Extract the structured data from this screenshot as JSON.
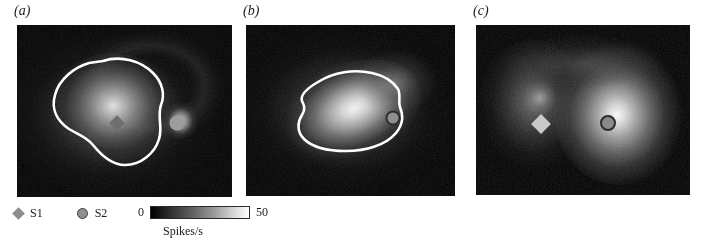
{
  "figure": {
    "background": "#ffffff",
    "width": 701,
    "height": 252
  },
  "panels": [
    {
      "label": "(a)",
      "label_x": 14,
      "label_y": 3,
      "x": 17,
      "y": 25,
      "w": 215,
      "h": 172,
      "has_contour": true,
      "markers": [
        {
          "type": "diamond",
          "name": "S1",
          "cx": 0.465,
          "cy": 0.57,
          "size": 11,
          "fill": "#6f6f6f"
        },
        {
          "type": "circle",
          "name": "S2",
          "cx": 0.745,
          "cy": 0.57,
          "size": 15,
          "fill": "#9d9d9d"
        }
      ]
    },
    {
      "label": "(b)",
      "label_x": 243,
      "label_y": 3,
      "x": 246,
      "y": 25,
      "w": 209,
      "h": 171,
      "has_contour": true,
      "markers": [
        {
          "type": "circle",
          "name": "S2",
          "cx": 0.705,
          "cy": 0.545,
          "size": 15,
          "fill": "#6b6b6b"
        }
      ]
    },
    {
      "label": "(c)",
      "label_x": 473,
      "label_y": 3,
      "x": 476,
      "y": 25,
      "w": 214,
      "h": 170,
      "has_contour": false,
      "markers": [
        {
          "type": "diamond",
          "name": "S1",
          "cx": 0.305,
          "cy": 0.585,
          "size": 14,
          "fill": "#c9c9c9"
        },
        {
          "type": "circle",
          "name": "S2",
          "cx": 0.615,
          "cy": 0.575,
          "size": 16,
          "fill": "#6e6e6e"
        }
      ]
    }
  ],
  "legend": {
    "x": 14,
    "y": 206,
    "items": [
      {
        "icon": "diamond-marker-icon",
        "label": "S1",
        "color": "#8d8d8d"
      },
      {
        "icon": "circle-marker-icon",
        "label": "S2",
        "color": "#909090"
      }
    ]
  },
  "colorbar": {
    "x": 138,
    "y": 205,
    "min_label": "0",
    "max_label": "50",
    "caption": "Spikes/s",
    "caption_x": 163,
    "caption_y": 224,
    "low_color": "#000000",
    "high_color": "#ffffff",
    "units": "Spikes/s",
    "range": [
      0,
      50
    ]
  }
}
